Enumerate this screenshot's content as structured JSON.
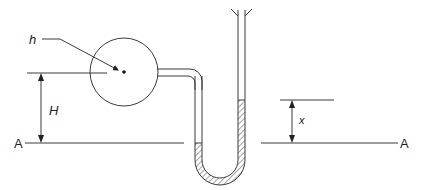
{
  "diagram": {
    "type": "manometer",
    "labels": {
      "h": "h",
      "H": "H",
      "x": "x",
      "A_left": "A",
      "A_right": "A"
    },
    "colors": {
      "line": "#3a3a3a",
      "background": "#ffffff"
    },
    "components": [
      "spherical vessel with center point",
      "connecting horizontal pipe",
      "U-tube manometer with hatched liquid",
      "open funnel top on right limb",
      "reference datum line A-A",
      "dimension H (vessel center to datum)",
      "dimension x (liquid rise above datum)"
    ]
  }
}
